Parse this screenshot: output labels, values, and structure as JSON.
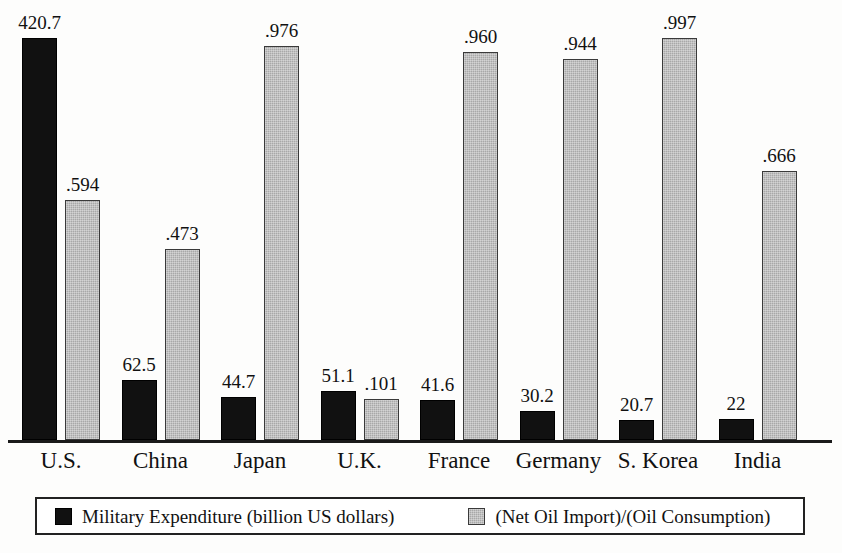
{
  "chart_data": {
    "type": "bar",
    "title": "",
    "subtitle": "",
    "xlabel": "",
    "ylabel": "",
    "grid": false,
    "legend_position": "bottom",
    "categories": [
      "U.S.",
      "China",
      "Japan",
      "U.K.",
      "France",
      "Germany",
      "S. Korea",
      "India"
    ],
    "series": [
      {
        "name": "Military Expenditure (billion US dollars)",
        "key": "military",
        "color": "#111111",
        "axis": "left",
        "ylim": [
          0,
          460
        ],
        "values": [
          420.7,
          62.5,
          44.7,
          51.1,
          41.6,
          30.2,
          20.7,
          22
        ],
        "labels": [
          "420.7",
          "62.5",
          "44.7",
          "51.1",
          "41.6",
          "30.2",
          "20.7",
          "22"
        ]
      },
      {
        "name": "(Net Oil Import)/(Oil Consumption)",
        "key": "oil",
        "color": "#a8a8a8",
        "axis": "right",
        "ylim": [
          0,
          1.09
        ],
        "values": [
          0.594,
          0.473,
          0.976,
          0.101,
          0.96,
          0.944,
          0.997,
          0.666
        ],
        "labels": [
          ".594",
          ".473",
          ".976",
          ".101",
          ".960",
          ".944",
          ".997",
          ".666"
        ]
      }
    ]
  },
  "legend": {
    "entries": [
      {
        "swatch": "black-square-swatch",
        "label": "Military Expenditure (billion US dollars)"
      },
      {
        "swatch": "gray-square-swatch",
        "label": "(Net Oil Import)/(Oil Consumption)"
      }
    ]
  }
}
